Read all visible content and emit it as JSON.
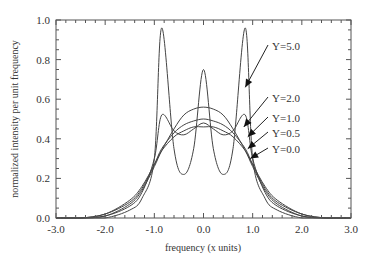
{
  "chart_data": {
    "type": "line",
    "title": "",
    "xlabel": "frequency (x units)",
    "ylabel": "normalized intensity per unit frequency",
    "xlim": [
      -3.0,
      3.0
    ],
    "ylim": [
      0.0,
      1.0
    ],
    "xticks": [
      "-3.0",
      "-2.0",
      "-1.0",
      "0.0",
      "1.0",
      "2.0",
      "3.0"
    ],
    "yticks": [
      "0.0",
      "0.2",
      "0.4",
      "0.6",
      "0.8",
      "1.0"
    ],
    "grid": false,
    "legend": "annotations with arrows (right side)",
    "x": [
      -3.0,
      -2.5,
      -2.0,
      -1.5,
      -1.25,
      -1.0,
      -0.85,
      -0.6,
      -0.4,
      -0.2,
      0.0,
      0.2,
      0.4,
      0.6,
      0.85,
      1.0,
      1.25,
      1.5,
      2.0,
      2.5,
      3.0
    ],
    "series": [
      {
        "name": "Y=5.0",
        "values": [
          0.0,
          0.0,
          0.0,
          0.04,
          0.1,
          0.3,
          0.96,
          0.35,
          0.22,
          0.35,
          0.75,
          0.35,
          0.22,
          0.35,
          0.96,
          0.3,
          0.1,
          0.04,
          0.0,
          0.0,
          0.0
        ]
      },
      {
        "name": "Y=2.0",
        "values": [
          0.0,
          0.0,
          0.01,
          0.06,
          0.13,
          0.3,
          0.52,
          0.44,
          0.42,
          0.45,
          0.48,
          0.45,
          0.42,
          0.44,
          0.52,
          0.3,
          0.13,
          0.06,
          0.01,
          0.0,
          0.0
        ]
      },
      {
        "name": "Y=1.0",
        "values": [
          0.0,
          0.0,
          0.01,
          0.07,
          0.14,
          0.26,
          0.34,
          0.45,
          0.52,
          0.55,
          0.56,
          0.55,
          0.52,
          0.45,
          0.34,
          0.26,
          0.14,
          0.07,
          0.01,
          0.0,
          0.0
        ]
      },
      {
        "name": "Y=0.5",
        "values": [
          0.0,
          0.0,
          0.02,
          0.08,
          0.15,
          0.27,
          0.35,
          0.43,
          0.47,
          0.49,
          0.5,
          0.49,
          0.47,
          0.43,
          0.35,
          0.27,
          0.15,
          0.08,
          0.02,
          0.0,
          0.0
        ]
      },
      {
        "name": "Y=0.0",
        "values": [
          0.0,
          0.0,
          0.02,
          0.09,
          0.16,
          0.27,
          0.34,
          0.41,
          0.44,
          0.46,
          0.46,
          0.46,
          0.44,
          0.41,
          0.34,
          0.27,
          0.16,
          0.09,
          0.02,
          0.0,
          0.0
        ]
      }
    ],
    "annotations": [
      {
        "text": "Y=5.0",
        "arrow_to": [
          0.85,
          0.66
        ]
      },
      {
        "text": "Y=2.0",
        "arrow_to": [
          0.82,
          0.46
        ]
      },
      {
        "text": "Y=1.0",
        "arrow_to": [
          0.9,
          0.41
        ]
      },
      {
        "text": "Y=0.5",
        "arrow_to": [
          0.9,
          0.35
        ]
      },
      {
        "text": "Y=0.0",
        "arrow_to": [
          0.95,
          0.3
        ]
      }
    ]
  }
}
